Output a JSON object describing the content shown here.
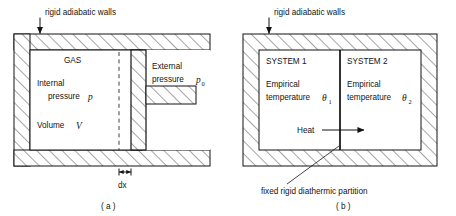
{
  "figure": {
    "panels": [
      {
        "id": "a",
        "caption": "( a )",
        "callout": "rigid adiabatic walls",
        "labels": {
          "gas": "GAS",
          "internal": "Internal",
          "internal_pressure": "pressure",
          "internal_symbol": "p",
          "volume": "Volume",
          "volume_symbol": "V",
          "external": "External",
          "external_pressure": "pressure",
          "external_symbol": "p",
          "external_subscript": "0",
          "dx": "dx"
        }
      },
      {
        "id": "b",
        "caption": "( b )",
        "callout": "rigid adiabatic walls",
        "labels": {
          "system1": "SYSTEM 1",
          "system2": "SYSTEM 2",
          "empirical": "Empirical",
          "temperature": "temperature",
          "theta1_symbol": "θ",
          "theta1_subscript": "1",
          "theta2_symbol": "θ",
          "theta2_subscript": "2",
          "heat": "Heat",
          "partition_note": "fixed rigid diathermic partition"
        }
      }
    ],
    "colors": {
      "ink": "#121212",
      "paper": "#ffffff",
      "hatch": "#121212"
    },
    "icons": {
      "callout_arrow": "down-arrow-icon",
      "heat_arrow": "right-arrow-icon",
      "dimension": "dx-dimension-marker-icon",
      "leader": "leader-line-icon"
    }
  }
}
